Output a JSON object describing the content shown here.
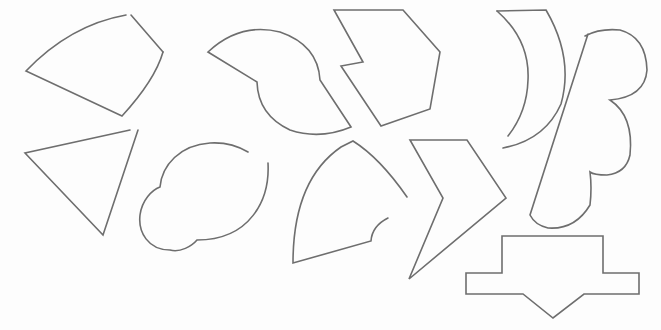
{
  "figure": {
    "stroke_color": "#6e6e6e",
    "background_color": "#ffffff",
    "shape_count": 11
  },
  "shapes": [
    {
      "id": "circular-sector-topleft",
      "kind": "curved sector with broken corner"
    },
    {
      "id": "triangle-left",
      "kind": "open triangle"
    },
    {
      "id": "two-circle-blob",
      "kind": "overlapping circles outline with gap"
    },
    {
      "id": "s-curve-piece",
      "kind": "shape with two concave/convex arcs"
    },
    {
      "id": "notched-hexagon",
      "kind": "hexagon with notch"
    },
    {
      "id": "quarter-arc-piece",
      "kind": "sector with small arc notch"
    },
    {
      "id": "chevron",
      "kind": "arrow / chevron polygon"
    },
    {
      "id": "crescent",
      "kind": "crescent with open end"
    },
    {
      "id": "double-bump-piece",
      "kind": "slanted piece with two semicircular bumps"
    },
    {
      "id": "down-arrow-block",
      "kind": "T-shaped block with down pointing arrow"
    }
  ]
}
